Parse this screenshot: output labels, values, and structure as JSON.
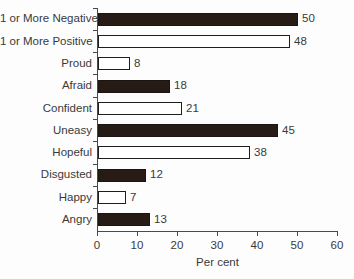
{
  "chart_data": {
    "type": "bar",
    "orientation": "horizontal",
    "title": "",
    "xlabel": "Per cent",
    "ylabel": "",
    "categories": [
      "1 or More Negative",
      "1 or More Positive",
      "Proud",
      "Afraid",
      "Confident",
      "Uneasy",
      "Hopeful",
      "Disgusted",
      "Happy",
      "Angry"
    ],
    "values": [
      50,
      48,
      8,
      18,
      21,
      45,
      38,
      12,
      7,
      13
    ],
    "bar_styles": [
      "dark",
      "light",
      "light",
      "dark",
      "light",
      "dark",
      "light",
      "dark",
      "light",
      "dark"
    ],
    "xlim": [
      0,
      60
    ],
    "xticks": [
      0,
      10,
      20,
      30,
      40,
      50,
      60
    ],
    "grid": false,
    "data_labels": true,
    "legend": "none",
    "colors": {
      "dark_bar": "#261b15",
      "light_bar_fill": "#ffffff",
      "bar_border": "#1e1e1e",
      "axis": "#4a4a4a",
      "text": "#3a3a3a",
      "background": "#fdfdfd"
    }
  }
}
